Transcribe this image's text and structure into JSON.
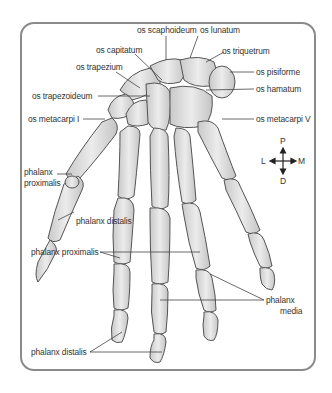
{
  "diagram": {
    "colors": {
      "bone_fill": "#dcdcdc",
      "bone_outline": "#555555",
      "frame": "#8a8a8a",
      "leader": "#444444",
      "text": "#333333"
    },
    "labels": {
      "scaphoideum": "os scaphoideum",
      "lunatum": "os lunatum",
      "capitatum": "os capitatum",
      "triquetrum": "os triquetrum",
      "trapezium": "os trapezium",
      "pisiforme": "os pisiforme",
      "hamatum": "os hamatum",
      "trapezoideum": "os trapezoideum",
      "metacarpi_1": "os metacarpi I",
      "metacarpi_5": "os metacarpi V",
      "thumb_prox_1": "phalanx",
      "thumb_prox_2": "proximalis",
      "thumb_distalis": "phalanx distalis",
      "phalanx_proximalis": "phalanx proximalis",
      "media_1": "phalanx",
      "media_2": "media",
      "phalanx_distalis": "phalanx distalis"
    },
    "compass": {
      "top": "P",
      "bottom": "D",
      "left": "L",
      "right": "M"
    }
  }
}
